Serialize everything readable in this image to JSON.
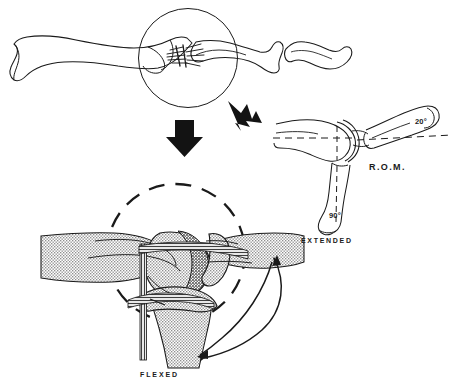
{
  "figure": {
    "background_color": "#ffffff",
    "ink_color": "#1a1a1a",
    "bone_fill_color": "#d9d9d9",
    "cartilage_fill_color": "#bfbfbf",
    "panels": [
      {
        "id": "panel-top",
        "name": "suture-repair-overview",
        "caption": ""
      },
      {
        "id": "panel-rom",
        "name": "range-of-motion-diagram",
        "caption": "R.O.M."
      },
      {
        "id": "panel-bottom",
        "name": "flexed-joint-cross-section",
        "caption": "FLEXED"
      }
    ]
  },
  "labels": {
    "rom": "R.O.M.",
    "extended": "EXTENDED",
    "flexed": "FLEXED",
    "angle_extension": "20°",
    "angle_flexion": "90°"
  },
  "annotations": {
    "magnifier_circle_top": "solid-circle-callout",
    "magnifier_circle_bottom": "dashed-circle-callout",
    "arrow_down": "solid-black-down-arrow",
    "arrow_diagonal": "solid-black-diagonal-arrow",
    "rom_arc_arrow": "double-headed-curved-arrow"
  }
}
